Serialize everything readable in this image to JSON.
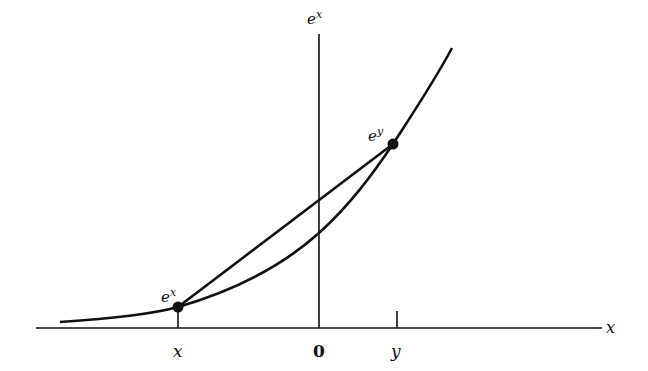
{
  "diagram": {
    "axes": {
      "x_axis_label": "x",
      "y_axis_label_base": "e",
      "y_axis_label_sup": "x",
      "origin_label": "0"
    },
    "points": [
      {
        "id": "left",
        "tick_label": "x",
        "value_label_base": "e",
        "value_label_sup": "x"
      },
      {
        "id": "right",
        "tick_label": "y",
        "value_label_base": "e",
        "value_label_sup": "y"
      }
    ],
    "colors": {
      "ink": "#111111",
      "background": "#ffffff"
    }
  }
}
